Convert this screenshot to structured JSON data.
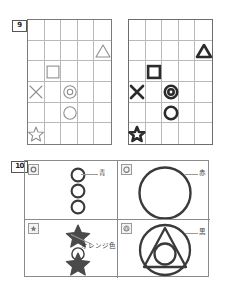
{
  "figure": {
    "kind": "worksheet-exercise-figures",
    "problems": [
      {
        "number": "9"
      },
      {
        "number": "10"
      }
    ]
  },
  "problem9": {
    "number": "9",
    "grid": {
      "cols": 5,
      "rows": 6
    },
    "panels": [
      {
        "name": "left-grid",
        "style": "thin-outline",
        "stroke_color": "#8f8f8f",
        "stroke_width": 1,
        "cells": [
          {
            "row": 2,
            "col": 5,
            "shape": "triangle"
          },
          {
            "row": 3,
            "col": 2,
            "shape": "square"
          },
          {
            "row": 4,
            "col": 1,
            "shape": "cross-x"
          },
          {
            "row": 4,
            "col": 3,
            "shape": "double-circle"
          },
          {
            "row": 5,
            "col": 3,
            "shape": "circle"
          },
          {
            "row": 6,
            "col": 1,
            "shape": "star"
          }
        ]
      },
      {
        "name": "right-grid",
        "style": "thick-filled",
        "stroke_color": "#2b2b2b",
        "stroke_width": 3,
        "cells": [
          {
            "row": 2,
            "col": 5,
            "shape": "triangle"
          },
          {
            "row": 3,
            "col": 2,
            "shape": "square"
          },
          {
            "row": 4,
            "col": 1,
            "shape": "cross-x"
          },
          {
            "row": 4,
            "col": 3,
            "shape": "double-circle"
          },
          {
            "row": 5,
            "col": 3,
            "shape": "circle"
          },
          {
            "row": 6,
            "col": 1,
            "shape": "star"
          }
        ]
      }
    ]
  },
  "problem10": {
    "number": "10",
    "panels": [
      {
        "name": "panel-top-left",
        "thumb_icon": "circle-thumbnail-icon",
        "caption": "青",
        "caption_meaning": "blue",
        "shapes": [
          "circle",
          "circle",
          "circle"
        ]
      },
      {
        "name": "panel-top-right",
        "thumb_icon": "big-circle-thumbnail-icon",
        "caption": "赤",
        "caption_meaning": "red",
        "shapes": [
          "large-circle"
        ]
      },
      {
        "name": "panel-bottom-left",
        "thumb_icon": "star-thumbnail-icon",
        "caption": "オレンジ色",
        "caption_meaning": "orange color",
        "shapes": [
          "star",
          "circle",
          "star"
        ]
      },
      {
        "name": "panel-bottom-right",
        "thumb_icon": "nested-shapes-thumbnail-icon",
        "caption": "黒",
        "caption_meaning": "black",
        "shapes": [
          "circle",
          "triangle",
          "circle"
        ]
      }
    ]
  },
  "colors": {
    "grid_line": "#b9b9b9",
    "grid_border": "#7a7a7a",
    "shape_thin": "#8f8f8f",
    "shape_thick": "#2b2b2b",
    "panel_border": "#8a8a8a",
    "text": "#3a3a3a"
  }
}
